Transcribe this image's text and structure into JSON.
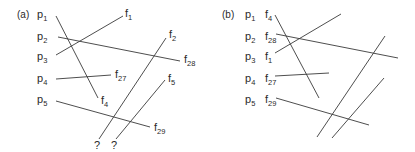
{
  "panels": [
    {
      "tag": "(a)",
      "left_labels": [
        {
          "base": "p",
          "sub": "1"
        },
        {
          "base": "p",
          "sub": "2"
        },
        {
          "base": "p",
          "sub": "3"
        },
        {
          "base": "p",
          "sub": "4"
        },
        {
          "base": "p",
          "sub": "5"
        }
      ],
      "right_labels": [
        {
          "base": "f",
          "sub": "1"
        },
        {
          "base": "f",
          "sub": "28"
        },
        {
          "base": "f",
          "sub": "27"
        },
        {
          "base": "f",
          "sub": "4"
        },
        {
          "base": "f",
          "sub": "29"
        },
        {
          "base": "f",
          "sub": "2"
        },
        {
          "base": "f",
          "sub": "5"
        }
      ],
      "unknown_labels": [
        "?",
        "?"
      ],
      "connections": [
        {
          "from": "p1",
          "to": "f4"
        },
        {
          "from": "p2",
          "to": "f28"
        },
        {
          "from": "p3",
          "to": "f1"
        },
        {
          "from": "p4",
          "to": "f27"
        },
        {
          "from": "p5",
          "to": "f29"
        },
        {
          "from": "?",
          "to": "f2"
        },
        {
          "from": "?",
          "to": "f5"
        }
      ]
    },
    {
      "tag": "(b)",
      "left_labels": [
        {
          "base": "p",
          "sub": "1"
        },
        {
          "base": "p",
          "sub": "2"
        },
        {
          "base": "p",
          "sub": "3"
        },
        {
          "base": "p",
          "sub": "4"
        },
        {
          "base": "p",
          "sub": "5"
        }
      ],
      "paired_labels": [
        {
          "base": "f",
          "sub": "4"
        },
        {
          "base": "f",
          "sub": "28"
        },
        {
          "base": "f",
          "sub": "1"
        },
        {
          "base": "f",
          "sub": "27"
        },
        {
          "base": "f",
          "sub": "29"
        }
      ]
    }
  ]
}
